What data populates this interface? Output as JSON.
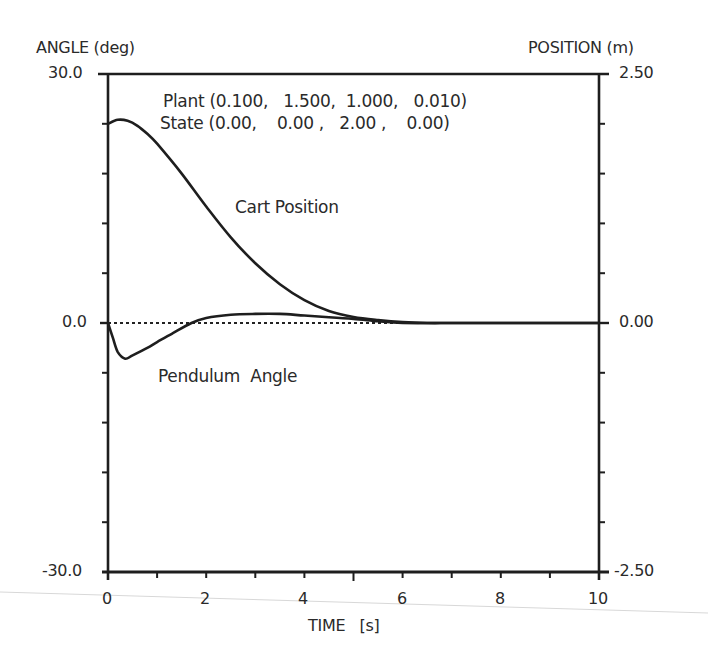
{
  "chart_data": {
    "type": "line",
    "title": "",
    "xlabel": "TIME   [s]",
    "ylabel_left": "ANGLE (deg)",
    "ylabel_right": "POSITION (m)",
    "xlim": [
      0,
      10
    ],
    "ylim_left": [
      -30.0,
      30.0
    ],
    "ylim_right": [
      -2.5,
      2.5
    ],
    "x_tick_labels": [
      "0",
      "2",
      "4",
      "6",
      "8",
      "10"
    ],
    "y_left_tick_labels": [
      "30.0",
      "0.0",
      "-30.0"
    ],
    "y_right_tick_labels": [
      "2.50",
      "0.00",
      "-2.50"
    ],
    "grid": false,
    "zero_line": "dotted",
    "annotations": {
      "plant": "Plant (0.100,   1.500,  1.000,   0.010)",
      "state": "State (0.00,    0.00 ,   2.00 ,    0.00)",
      "cart_label": "Cart Position",
      "pendulum_label": "Pendulum  Angle"
    },
    "series": [
      {
        "name": "Cart Position",
        "axis": "right",
        "unit": "m",
        "x": [
          0,
          0.2,
          0.4,
          0.6,
          0.8,
          1.0,
          1.5,
          2.0,
          2.5,
          3.0,
          3.5,
          4.0,
          4.5,
          5.0,
          5.5,
          6.0,
          6.5,
          7.0,
          8.0,
          9.0,
          10.0
        ],
        "values": [
          2.0,
          2.04,
          2.03,
          1.98,
          1.9,
          1.8,
          1.5,
          1.17,
          0.86,
          0.6,
          0.39,
          0.23,
          0.12,
          0.06,
          0.03,
          0.01,
          0.0,
          0.0,
          0.0,
          0.0,
          0.0
        ]
      },
      {
        "name": "Pendulum Angle",
        "axis": "left",
        "unit": "deg",
        "x": [
          0,
          0.1,
          0.2,
          0.35,
          0.5,
          0.8,
          1.0,
          1.3,
          1.7,
          2.0,
          2.5,
          3.0,
          3.5,
          4.0,
          4.5,
          5.0,
          5.5,
          6.0,
          7.0,
          8.0,
          10.0
        ],
        "values": [
          0.0,
          -1.8,
          -3.5,
          -4.3,
          -3.9,
          -3.0,
          -2.3,
          -1.3,
          0.0,
          0.6,
          1.0,
          1.1,
          1.1,
          0.9,
          0.7,
          0.5,
          0.2,
          0.0,
          0.0,
          0.0,
          0.0
        ]
      }
    ]
  },
  "axes": {
    "left_title": "ANGLE (deg)",
    "right_title": "POSITION (m)",
    "left_top": "30.0",
    "left_mid": "0.0",
    "left_bottom": "-30.0",
    "right_top": "2.50",
    "right_mid": "0.00",
    "right_bottom": "-2.50",
    "x_ticks": [
      "0",
      "2",
      "4",
      "6",
      "8",
      "10"
    ],
    "x_title": "TIME   [s]"
  }
}
